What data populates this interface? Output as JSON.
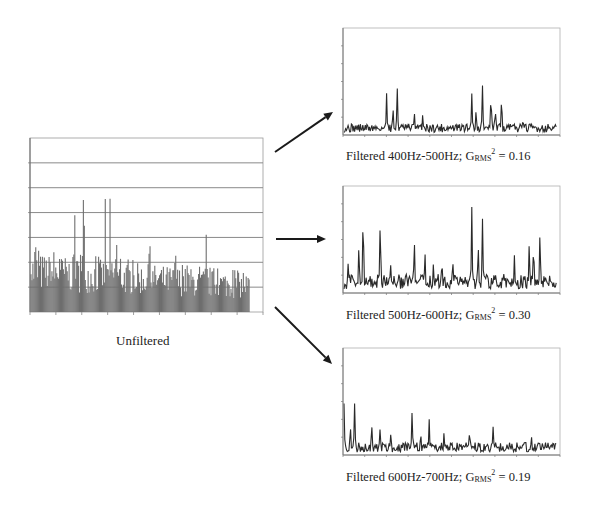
{
  "chart_data": [
    {
      "id": "unfiltered",
      "type": "bar",
      "title": "Unfiltered",
      "xlabel": "",
      "ylabel": "",
      "grid": true,
      "gridlines": 7,
      "xticks": 9,
      "ylim": [
        0,
        1
      ],
      "color": "#6e6e6e",
      "n_points": 230,
      "envelope_peaks": [
        {
          "x": 0.0,
          "y": 0.62
        },
        {
          "x": 0.02,
          "y": 0.6
        },
        {
          "x": 0.09,
          "y": 0.55
        },
        {
          "x": 0.13,
          "y": 0.57
        },
        {
          "x": 0.2,
          "y": 0.86
        },
        {
          "x": 0.24,
          "y": 0.91
        },
        {
          "x": 0.34,
          "y": 0.79
        },
        {
          "x": 0.36,
          "y": 0.74
        },
        {
          "x": 0.39,
          "y": 0.72
        },
        {
          "x": 0.54,
          "y": 0.61
        },
        {
          "x": 0.66,
          "y": 0.6
        },
        {
          "x": 0.8,
          "y": 0.54
        },
        {
          "x": 0.97,
          "y": 0.27
        }
      ],
      "baseline_level": 0.22
    },
    {
      "id": "band_400_500",
      "type": "line",
      "title": "Filtered 400Hz-500Hz; G_RMS^2 = 0.16",
      "band": "400Hz-500Hz",
      "grms2": 0.16,
      "ylim": [
        0,
        1
      ],
      "yticks": 6,
      "xticks": 10,
      "color": "#2a2a2a",
      "n_points": 260,
      "peaks": [
        {
          "x": 0.2,
          "y": 0.46
        },
        {
          "x": 0.23,
          "y": 0.31
        },
        {
          "x": 0.25,
          "y": 0.49
        },
        {
          "x": 0.33,
          "y": 0.28
        },
        {
          "x": 0.37,
          "y": 0.23
        },
        {
          "x": 0.6,
          "y": 0.47
        },
        {
          "x": 0.62,
          "y": 0.31
        },
        {
          "x": 0.65,
          "y": 0.49
        },
        {
          "x": 0.69,
          "y": 0.47
        },
        {
          "x": 0.71,
          "y": 0.31
        },
        {
          "x": 0.74,
          "y": 0.49
        },
        {
          "x": 0.84,
          "y": 0.2
        }
      ],
      "noise_level": 0.08
    },
    {
      "id": "band_500_600",
      "type": "line",
      "title": "Filtered 500Hz-600Hz; G_RMS^2 = 0.30",
      "band": "500Hz-600Hz",
      "grms2": 0.3,
      "ylim": [
        0,
        1
      ],
      "yticks": 6,
      "xticks": 10,
      "color": "#2a2a2a",
      "n_points": 260,
      "peaks": [
        {
          "x": 0.02,
          "y": 0.38
        },
        {
          "x": 0.07,
          "y": 0.56
        },
        {
          "x": 0.09,
          "y": 0.91
        },
        {
          "x": 0.17,
          "y": 0.84
        },
        {
          "x": 0.22,
          "y": 0.34
        },
        {
          "x": 0.33,
          "y": 0.56
        },
        {
          "x": 0.38,
          "y": 0.46
        },
        {
          "x": 0.42,
          "y": 0.37
        },
        {
          "x": 0.46,
          "y": 0.41
        },
        {
          "x": 0.51,
          "y": 0.41
        },
        {
          "x": 0.6,
          "y": 0.84
        },
        {
          "x": 0.63,
          "y": 0.56
        },
        {
          "x": 0.65,
          "y": 0.78
        },
        {
          "x": 0.8,
          "y": 0.38
        },
        {
          "x": 0.87,
          "y": 0.56
        },
        {
          "x": 0.89,
          "y": 0.56
        },
        {
          "x": 0.92,
          "y": 0.74
        }
      ],
      "noise_level": 0.14
    },
    {
      "id": "band_600_700",
      "type": "line",
      "title": "Filtered 600Hz-700Hz; G_RMS^2 = 0.19",
      "band": "600Hz-700Hz",
      "grms2": 0.19,
      "ylim": [
        0,
        1
      ],
      "yticks": 6,
      "xticks": 10,
      "color": "#2a2a2a",
      "n_points": 260,
      "peaks": [
        {
          "x": 0.0,
          "y": 0.52
        },
        {
          "x": 0.03,
          "y": 0.35
        },
        {
          "x": 0.05,
          "y": 0.57
        },
        {
          "x": 0.13,
          "y": 0.35
        },
        {
          "x": 0.17,
          "y": 0.29
        },
        {
          "x": 0.22,
          "y": 0.24
        },
        {
          "x": 0.32,
          "y": 0.5
        },
        {
          "x": 0.36,
          "y": 0.27
        },
        {
          "x": 0.4,
          "y": 0.33
        },
        {
          "x": 0.47,
          "y": 0.24
        },
        {
          "x": 0.59,
          "y": 0.28
        },
        {
          "x": 0.7,
          "y": 0.27
        },
        {
          "x": 0.88,
          "y": 0.22
        }
      ],
      "noise_level": 0.09
    }
  ],
  "captions": {
    "unfiltered": "Unfiltered",
    "band1": {
      "prefix": "Filtered 400Hz-500Hz; G",
      "sub": "RMS",
      "sup": "2",
      "suffix": " = 0.16"
    },
    "band2": {
      "prefix": "Filtered 500Hz-600Hz; G",
      "sub": "RMS",
      "sup": "2",
      "suffix": " = 0.30"
    },
    "band3": {
      "prefix": "Filtered 600Hz-700Hz; G",
      "sub": "RMS",
      "sup": "2",
      "suffix": " = 0.19"
    }
  },
  "arrows": [
    {
      "name": "arrow-to-400-500",
      "from": [
        275,
        152
      ],
      "to": [
        333,
        112
      ]
    },
    {
      "name": "arrow-to-500-600",
      "from": [
        276,
        239
      ],
      "to": [
        326,
        239
      ]
    },
    {
      "name": "arrow-to-600-700",
      "from": [
        275,
        307
      ],
      "to": [
        332,
        364
      ]
    }
  ]
}
